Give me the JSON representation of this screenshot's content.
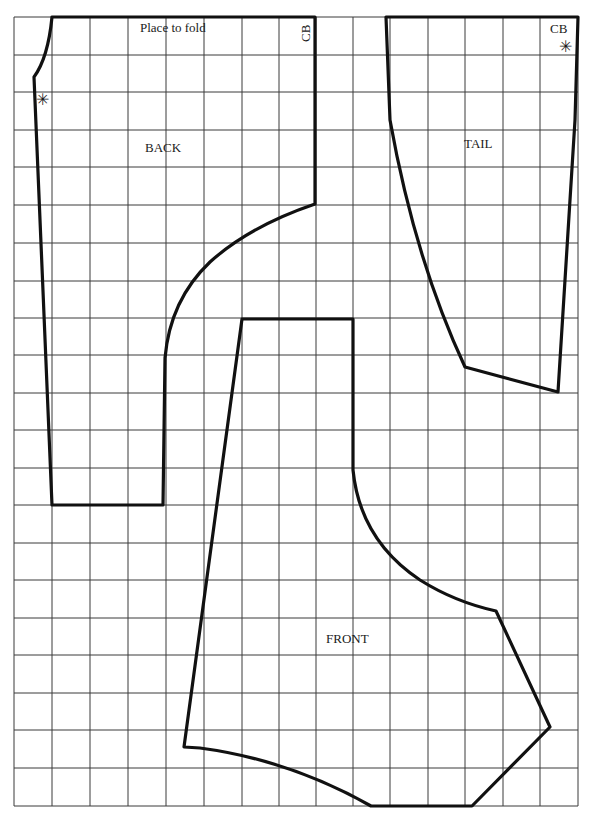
{
  "diagram": {
    "type": "sewing-pattern",
    "colors": {
      "background": "#ffffff",
      "grid": "#3a3a3a",
      "outline": "#111111",
      "text": "#1a1a1a"
    },
    "grid": {
      "x_lines": [
        14,
        52,
        90,
        128,
        166,
        204,
        242,
        279,
        316,
        353,
        390,
        428,
        465,
        503,
        540,
        578
      ],
      "y_lines": [
        17,
        55,
        92,
        130,
        167,
        205,
        243,
        281,
        318,
        355,
        393,
        430,
        468,
        505,
        543,
        580,
        618,
        655,
        693,
        730,
        768,
        806
      ]
    },
    "pieces": [
      {
        "name": "BACK",
        "label": "BACK",
        "fold_label": "Place to fold",
        "cb_label": "CB",
        "notch_mark": "✳"
      },
      {
        "name": "TAIL",
        "label": "TAIL",
        "cb_label": "CB",
        "notch_mark": "✳"
      },
      {
        "name": "FRONT",
        "label": "FRONT"
      }
    ]
  }
}
